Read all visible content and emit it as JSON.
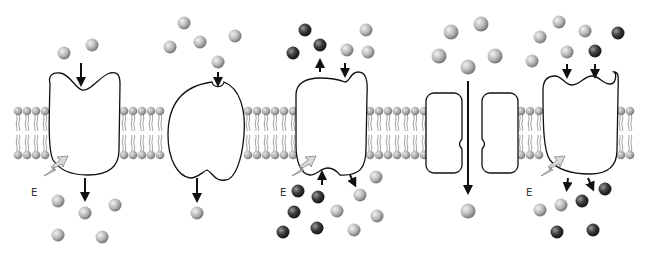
{
  "diagram": {
    "title": "",
    "panels": [
      {
        "id": "primary-active-transport",
        "label": "",
        "energy_label": "E"
      },
      {
        "id": "carrier-facilitated-diffusion",
        "label": ""
      },
      {
        "id": "antiport-active-transport",
        "label": "",
        "energy_label": "E"
      },
      {
        "id": "channel-diffusion",
        "label": ""
      },
      {
        "id": "symport-active-transport",
        "label": "",
        "energy_label": "E"
      }
    ],
    "colors": {
      "light_molecule": "#b8b8b8",
      "dark_molecule": "#3a3a3a",
      "phospholipid_head": "#a8a8a8",
      "protein_fill": "#ffffff",
      "outline": "#111111",
      "energy_bolt": "#d0d0d0"
    }
  }
}
